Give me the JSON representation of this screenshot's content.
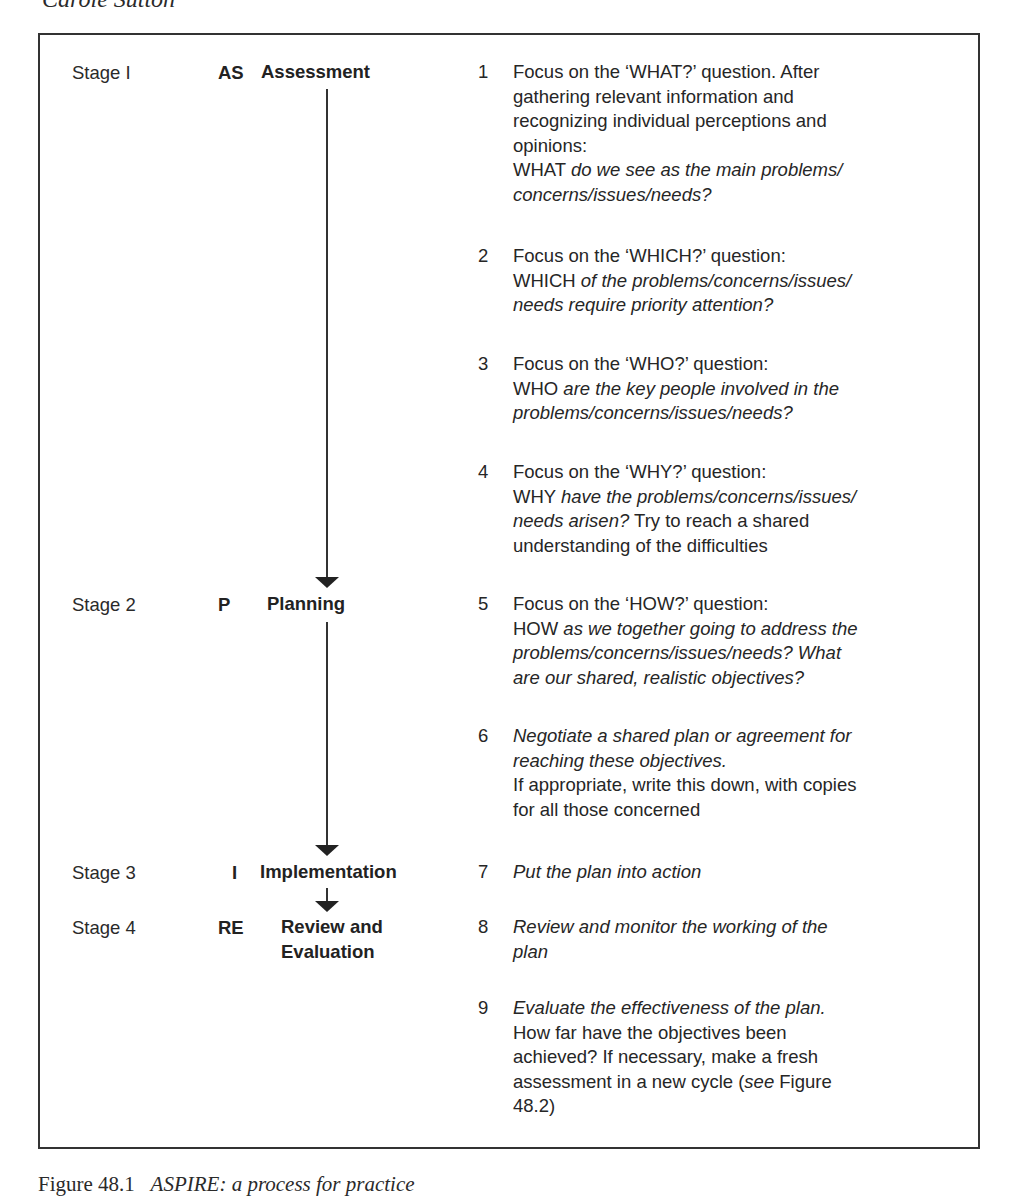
{
  "header": {
    "author": "Carole Sutton"
  },
  "stages": [
    {
      "label": "Stage I",
      "code": "AS",
      "name": "Assessment"
    },
    {
      "label": "Stage 2",
      "code": "P",
      "name": "Planning"
    },
    {
      "label": "Stage 3",
      "code": "I",
      "name": "Implementation"
    },
    {
      "label": "Stage 4",
      "code": "RE",
      "name_line1": "Review and",
      "name_line2": "Evaluation"
    }
  ],
  "steps": [
    {
      "num": "1",
      "lines": [
        {
          "segments": [
            {
              "t": "Focus on the ‘WHAT?’ question. After",
              "i": false
            }
          ]
        },
        {
          "segments": [
            {
              "t": "gathering relevant information and",
              "i": false
            }
          ]
        },
        {
          "segments": [
            {
              "t": "recognizing individual perceptions and",
              "i": false
            }
          ]
        },
        {
          "segments": [
            {
              "t": "opinions:",
              "i": false
            }
          ]
        },
        {
          "segments": [
            {
              "t": "WHAT ",
              "i": false
            },
            {
              "t": "do we see as the main problems/",
              "i": true
            }
          ]
        },
        {
          "segments": [
            {
              "t": "concerns/issues/needs?",
              "i": true
            }
          ]
        }
      ]
    },
    {
      "num": "2",
      "lines": [
        {
          "segments": [
            {
              "t": "Focus on the ‘WHICH?’ question:",
              "i": false
            }
          ]
        },
        {
          "segments": [
            {
              "t": "WHICH ",
              "i": false
            },
            {
              "t": "of the problems/concerns/issues/",
              "i": true
            }
          ]
        },
        {
          "segments": [
            {
              "t": "needs require priority attention?",
              "i": true
            }
          ]
        }
      ]
    },
    {
      "num": "3",
      "lines": [
        {
          "segments": [
            {
              "t": "Focus on the ‘WHO?’ question:",
              "i": false
            }
          ]
        },
        {
          "segments": [
            {
              "t": "WHO ",
              "i": false
            },
            {
              "t": "are the key people involved in the",
              "i": true
            }
          ]
        },
        {
          "segments": [
            {
              "t": "problems/concerns/issues/needs?",
              "i": true
            }
          ]
        }
      ]
    },
    {
      "num": "4",
      "lines": [
        {
          "segments": [
            {
              "t": "Focus on the ‘WHY?’ question:",
              "i": false
            }
          ]
        },
        {
          "segments": [
            {
              "t": "WHY ",
              "i": false
            },
            {
              "t": "have the problems/concerns/issues/",
              "i": true
            }
          ]
        },
        {
          "segments": [
            {
              "t": "needs arisen?",
              "i": true
            },
            {
              "t": " Try to reach a shared",
              "i": false
            }
          ]
        },
        {
          "segments": [
            {
              "t": "understanding of the difficulties",
              "i": false
            }
          ]
        }
      ]
    },
    {
      "num": "5",
      "lines": [
        {
          "segments": [
            {
              "t": "Focus on the ‘HOW?’ question:",
              "i": false
            }
          ]
        },
        {
          "segments": [
            {
              "t": "HOW ",
              "i": false
            },
            {
              "t": "as we together going to address the",
              "i": true
            }
          ]
        },
        {
          "segments": [
            {
              "t": "problems/concerns/issues/needs? What",
              "i": true
            }
          ]
        },
        {
          "segments": [
            {
              "t": "are our shared, realistic objectives?",
              "i": true
            }
          ]
        }
      ]
    },
    {
      "num": "6",
      "lines": [
        {
          "segments": [
            {
              "t": "Negotiate a shared plan or agreement for",
              "i": true
            }
          ]
        },
        {
          "segments": [
            {
              "t": "reaching these objectives.",
              "i": true
            }
          ]
        },
        {
          "segments": [
            {
              "t": "If appropriate, write this down, with copies",
              "i": false
            }
          ]
        },
        {
          "segments": [
            {
              "t": "for all those concerned",
              "i": false
            }
          ]
        }
      ]
    },
    {
      "num": "7",
      "lines": [
        {
          "segments": [
            {
              "t": "Put the plan into action",
              "i": true
            }
          ]
        }
      ]
    },
    {
      "num": "8",
      "lines": [
        {
          "segments": [
            {
              "t": "Review and monitor the working of the",
              "i": true
            }
          ]
        },
        {
          "segments": [
            {
              "t": "plan",
              "i": true
            }
          ]
        }
      ]
    },
    {
      "num": "9",
      "lines": [
        {
          "segments": [
            {
              "t": "Evaluate the effectiveness of the plan.",
              "i": true
            }
          ]
        },
        {
          "segments": [
            {
              "t": "How far have the objectives been",
              "i": false
            }
          ]
        },
        {
          "segments": [
            {
              "t": "achieved? If necessary, make a fresh",
              "i": false
            }
          ]
        },
        {
          "segments": [
            {
              "t": "assessment in a new cycle (",
              "i": false
            },
            {
              "t": "see",
              "i": true
            },
            {
              "t": " Figure",
              "i": false
            }
          ]
        },
        {
          "segments": [
            {
              "t": "48.2)",
              "i": false
            }
          ]
        }
      ]
    }
  ],
  "caption": {
    "label": "Figure 48.1",
    "title": "ASPIRE: a process for practice"
  }
}
